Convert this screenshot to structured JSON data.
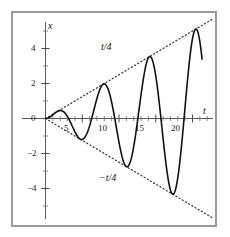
{
  "chart_data": {
    "type": "line",
    "title": "",
    "xlabel": "t",
    "ylabel": "x",
    "xlim": [
      -1.2,
      22.5
    ],
    "ylim": [
      -5.9,
      6.1
    ],
    "grid": false,
    "legend": "none",
    "xticks": [
      5,
      10,
      15,
      20
    ],
    "xtick_labels": [
      "5",
      "10",
      "15",
      "20"
    ],
    "xtick_minor_step": 1,
    "yticks": [
      4,
      2,
      0,
      -2,
      -4
    ],
    "ytick_labels": [
      "4",
      "2",
      "0",
      "-2",
      "-4"
    ],
    "ytick_minor_step": 1,
    "series": [
      {
        "name": "x(t)",
        "style": "solid",
        "color": "#111111",
        "formula": "x = (t/4) * sin(t)",
        "t_start": 0,
        "t_end": 21.3,
        "points_note": "damped-growth oscillation, amplitude grows linearly as t/4",
        "peaks_t": [
          1.6,
          4.7,
          7.9,
          11.0,
          14.1,
          17.3,
          20.4
        ],
        "peaks_x": [
          0.4,
          1.15,
          1.95,
          2.75,
          3.5,
          4.3,
          5.1
        ],
        "troughs_t": [
          3.2,
          6.3,
          9.4,
          12.6,
          15.7,
          18.9
        ],
        "troughs_x": [
          -0.8,
          -1.55,
          -2.35,
          -3.15,
          -3.9,
          -4.7
        ],
        "end_t": 21.3,
        "end_x": 2.05
      },
      {
        "name": "upper envelope",
        "style": "dotted",
        "color": "#3a3a3a",
        "formula": "x = t/4",
        "label": "t/4",
        "label_t": 8.1,
        "label_x": 2.9
      },
      {
        "name": "lower envelope",
        "style": "dotted",
        "color": "#3a3a3a",
        "formula": "x = -t/4",
        "label": "-t/4",
        "label_t": 8.6,
        "label_x": -3.45
      }
    ],
    "annotations": [
      {
        "text": "t/4",
        "role": "upper-envelope-label"
      },
      {
        "text": "-t/4",
        "role": "lower-envelope-label"
      },
      {
        "text": "x",
        "role": "y-axis-name"
      },
      {
        "text": "t",
        "role": "x-axis-name"
      }
    ],
    "colors": {
      "curve": "#111111",
      "envelope": "#3a3a3a",
      "axis": "#555555",
      "frame": "#9a9a9a",
      "background": "#ffffff",
      "text": "#1a1a1a"
    }
  },
  "labels": {
    "y_axis_name": "x",
    "x_axis_name": "t",
    "upper_envelope": "t/4",
    "lower_envelope": "−t/4",
    "x_ticks": [
      "5",
      "10",
      "15",
      "20"
    ],
    "y_ticks": [
      "4",
      "2",
      "0",
      "−2",
      "−4"
    ]
  }
}
